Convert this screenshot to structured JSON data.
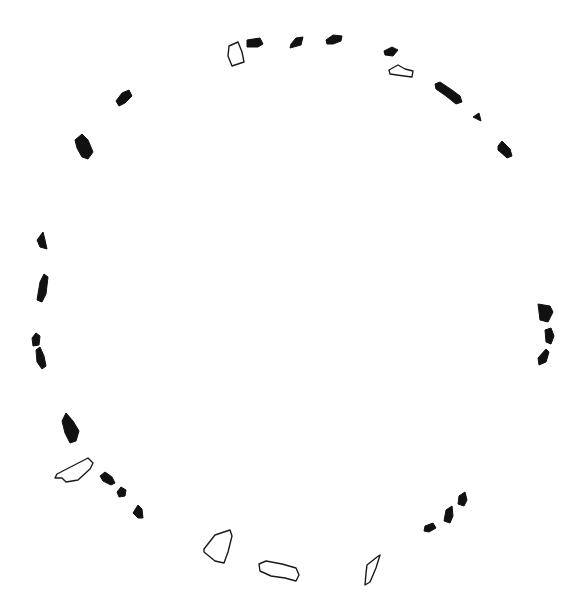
{
  "diagram": {
    "type": "stone-circle-plan",
    "background": "#ffffff",
    "colors": {
      "filled_stone": "#111111",
      "outline_stone": "#1a1a1a"
    },
    "legend_visible": false,
    "stones": [
      {
        "id": "s1",
        "style": "outline",
        "points": "229,46 238,42 242,52 244,62 232,66 228,56"
      },
      {
        "id": "s2",
        "style": "filled",
        "points": "247,40 260,38 263,44 258,47 247,47"
      },
      {
        "id": "s3",
        "style": "filled",
        "points": "291,44 296,38 303,37 301,45 290,48"
      },
      {
        "id": "s4",
        "style": "filled",
        "points": "326,40 333,35 342,36 341,41 333,44 327,44"
      },
      {
        "id": "s5",
        "style": "filled",
        "points": "384,51 392,47 398,50 393,56 385,55"
      },
      {
        "id": "s6",
        "style": "outline",
        "points": "389,70 398,65 405,69 413,71 412,77 404,76 397,75 390,74"
      },
      {
        "id": "s7",
        "style": "filled",
        "points": "435,84 440,82 452,90 460,96 462,102 456,104 446,96 436,89"
      },
      {
        "id": "s8",
        "style": "filled",
        "points": "473,117 479,113 481,121"
      },
      {
        "id": "s9",
        "style": "filled",
        "points": "498,146 502,141 510,149 512,156 507,158 498,150"
      },
      {
        "id": "s10",
        "style": "filled",
        "points": "116,101 122,93 129,90 132,96 125,103 119,106"
      },
      {
        "id": "s11",
        "style": "filled",
        "points": "75,140 82,134 88,140 93,152 88,159 82,157 77,148"
      },
      {
        "id": "s12",
        "style": "filled",
        "points": "37,240 43,232 45,240 47,249 40,247"
      },
      {
        "id": "s13",
        "style": "filled",
        "points": "40,282 44,274 48,277 46,294 42,302 37,300"
      },
      {
        "id": "s14",
        "style": "filled",
        "points": "32,338 36,333 40,336 39,345 33,346"
      },
      {
        "id": "s15",
        "style": "filled",
        "points": "36,350 40,347 44,356 46,366 42,369 37,362"
      },
      {
        "id": "s16",
        "style": "filled",
        "points": "62,421 66,413 73,421 79,431 76,441 70,443 65,433"
      },
      {
        "id": "s17",
        "style": "outline",
        "points": "57,474 88,458 93,463 90,469 78,480 66,482 62,478 55,478"
      },
      {
        "id": "s18",
        "style": "filled",
        "points": "100,476 105,472 112,477 115,483 111,485 103,481"
      },
      {
        "id": "s19",
        "style": "filled",
        "points": "117,492 121,487 126,490 125,496 119,497"
      },
      {
        "id": "s20",
        "style": "filled",
        "points": "133,513 138,505 142,509 143,518 138,518"
      },
      {
        "id": "s21",
        "style": "outline",
        "points": "204,549 215,535 230,530 232,536 228,552 224,563 215,561 204,552"
      },
      {
        "id": "s22",
        "style": "outline",
        "points": "259,564 266,561 282,564 296,568 299,575 296,581 285,578 271,576 260,571"
      },
      {
        "id": "s23",
        "style": "outline",
        "points": "367,565 377,557 380,555 376,568 370,582 365,585 366,573"
      },
      {
        "id": "s24",
        "style": "filled",
        "points": "425,526 433,523 436,528 429,532 424,531"
      },
      {
        "id": "s25",
        "style": "filled",
        "points": "446,510 452,506 453,516 450,523 444,521"
      },
      {
        "id": "s26",
        "style": "filled",
        "points": "459,496 465,492 467,500 464,506 458,504"
      },
      {
        "id": "s27",
        "style": "filled",
        "points": "538,304 550,306 553,312 548,322 540,320"
      },
      {
        "id": "s28",
        "style": "filled",
        "points": "545,330 551,328 554,336 551,344 546,342"
      },
      {
        "id": "s29",
        "style": "filled",
        "points": "538,358 546,349 549,352 546,362 539,365"
      }
    ]
  }
}
